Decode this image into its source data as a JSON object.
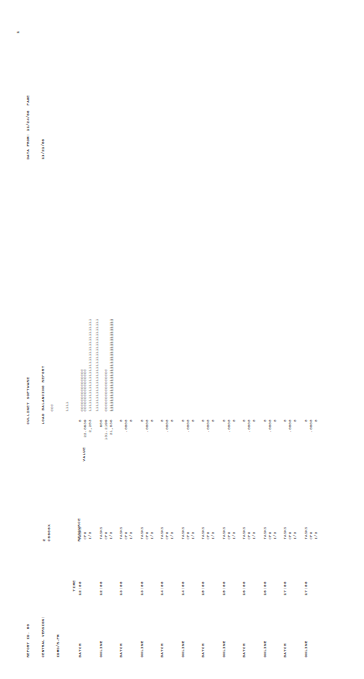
{
  "document": {
    "kind": "mainframe-line-printer-report",
    "orientation": "rotated-90-ccw",
    "page_number": "1"
  },
  "header": {
    "report_id_line": "REPORT ID. 80",
    "central_version_line": "CENTRAL VERSION:",
    "product_line": "IDMS/R-PM",
    "central_version_value": "2",
    "system_id": "C8606X",
    "title_line1": "CULLINET SOFTWARE",
    "title_line2": "LOAD BALANCING REPORT",
    "data_from_line1": "DATA FROM: 11/24/86  PAGE",
    "data_from_line2": "11/21/86",
    "page_label": "1"
  },
  "columns": {
    "time": "TIME",
    "resource": "RESOURCE",
    "value": "VALUE"
  },
  "legend": {
    "line1": "CCC",
    "line2": "1111",
    "line3": "CCCCCCCCCCCCCCCCC",
    "line4": "1111111111111111111111111111111111111",
    "line5": "1111111111111111111111111111111111111"
  },
  "resource_labels": [
    "TASKS",
    "CPU",
    "I/O"
  ],
  "rows": [
    {
      "category": "BATCH",
      "time": "12:00",
      "resources": [
        "TASKS",
        "CPU",
        "I/O"
      ],
      "values": [
        "5",
        "22.8639",
        "2,253"
      ],
      "bars": [
        "",
        "CCCCCCCCCCCCCCCCC",
        "1111111111111111111111111111111111111"
      ]
    },
    {
      "category": "ONLINE",
      "time": "12:00",
      "resources": [
        "TASKS",
        "CPU",
        "I/O"
      ],
      "values": [
        "655",
        "131.2199",
        "21,836"
      ],
      "bars": [
        "",
        "CCCCCCCCCCCCCCCCC",
        "1111111111111111111111111111111111111"
      ]
    },
    {
      "category": "BATCH",
      "time": "13:00",
      "resources": [
        "TASKS",
        "CPU",
        "I/O"
      ],
      "values": [
        "0",
        ".0000",
        "0"
      ],
      "bars": [
        "",
        "",
        ""
      ]
    },
    {
      "category": "ONLINE",
      "time": "13:00",
      "resources": [
        "TASKS",
        "CPU",
        "I/O"
      ],
      "values": [
        "0",
        ".0000",
        "0"
      ],
      "bars": [
        "",
        "",
        ""
      ]
    },
    {
      "category": "BATCH",
      "time": "14:00",
      "resources": [
        "TASKS",
        "CPU",
        "I/O"
      ],
      "values": [
        "0",
        ".0000",
        "0"
      ],
      "bars": [
        "",
        "",
        ""
      ]
    },
    {
      "category": "ONLINE",
      "time": "14:00",
      "resources": [
        "TASKS",
        "CPU",
        "I/O"
      ],
      "values": [
        "0",
        ".0000",
        "0"
      ],
      "bars": [
        "",
        "",
        ""
      ]
    },
    {
      "category": "BATCH",
      "time": "15:00",
      "resources": [
        "TASKS",
        "CPU",
        "I/O"
      ],
      "values": [
        "0",
        ".0000",
        "0"
      ],
      "bars": [
        "",
        "",
        ""
      ]
    },
    {
      "category": "ONLINE",
      "time": "15:00",
      "resources": [
        "TASKS",
        "CPU",
        "I/O"
      ],
      "values": [
        "0",
        ".0000",
        "0"
      ],
      "bars": [
        "",
        "",
        ""
      ]
    },
    {
      "category": "BATCH",
      "time": "16:00",
      "resources": [
        "TASKS",
        "CPU",
        "I/O"
      ],
      "values": [
        "0",
        ".0000",
        "0"
      ],
      "bars": [
        "",
        "",
        ""
      ]
    },
    {
      "category": "ONLINE",
      "time": "16:00",
      "resources": [
        "TASKS",
        "CPU",
        "I/O"
      ],
      "values": [
        "0",
        ".0000",
        "0"
      ],
      "bars": [
        "",
        "",
        ""
      ]
    },
    {
      "category": "BATCH",
      "time": "17:00",
      "resources": [
        "TASKS",
        "CPU",
        "I/O"
      ],
      "values": [
        "0",
        ".0000",
        "0"
      ],
      "bars": [
        "",
        "",
        ""
      ]
    },
    {
      "category": "ONLINE",
      "time": "17:00",
      "resources": [
        "TASKS",
        "CPU",
        "I/O"
      ],
      "values": [
        "0",
        ".0000",
        "0"
      ],
      "bars": [
        "",
        "",
        ""
      ]
    }
  ],
  "chart_data": {
    "type": "bar",
    "title": "LOAD BALANCING REPORT",
    "xlabel": "",
    "ylabel": "TIME / CATEGORY",
    "categories": [
      "BATCH 12:00",
      "ONLINE 12:00",
      "BATCH 13:00",
      "ONLINE 13:00",
      "BATCH 14:00",
      "ONLINE 14:00",
      "BATCH 15:00",
      "ONLINE 15:00",
      "BATCH 16:00",
      "ONLINE 16:00",
      "BATCH 17:00",
      "ONLINE 17:00"
    ],
    "series": [
      {
        "name": "TASKS",
        "values": [
          5,
          655,
          0,
          0,
          0,
          0,
          0,
          0,
          0,
          0,
          0,
          0
        ]
      },
      {
        "name": "CPU",
        "values": [
          22.8639,
          131.2199,
          0.0,
          0.0,
          0.0,
          0.0,
          0.0,
          0.0,
          0.0,
          0.0,
          0.0,
          0.0
        ]
      },
      {
        "name": "I/O",
        "values": [
          2253,
          21836,
          0,
          0,
          0,
          0,
          0,
          0,
          0,
          0,
          0,
          0
        ]
      }
    ],
    "bar_glyphs": {
      "CPU": "C",
      "I/O": "1"
    },
    "grid": false,
    "legend_position": "top"
  }
}
